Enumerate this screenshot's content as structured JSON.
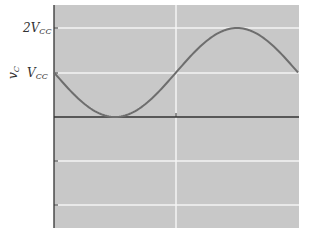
{
  "chart_data": {
    "type": "line",
    "title": "",
    "xlabel": "",
    "ylabel": "v_C",
    "ylabel_display": "vC",
    "y_ticks": [
      {
        "label": "2V_CC",
        "value": 2
      },
      {
        "label": "V_CC",
        "value": 1
      }
    ],
    "ylim": [
      -2.5,
      2.5
    ],
    "xlim": [
      0,
      6.2832
    ],
    "grid": true,
    "series": [
      {
        "name": "v_C",
        "function": "V_CC - V_CC*sin(theta)",
        "x": [
          0,
          0.785,
          1.571,
          2.356,
          3.142,
          3.927,
          4.712,
          5.498,
          6.283
        ],
        "values": [
          1,
          0.29,
          0,
          0.29,
          1,
          1.71,
          2,
          1.71,
          1
        ]
      }
    ],
    "colors": {
      "plot_bg": "#c8c8c8",
      "grid": "#f4f4f4",
      "curve": "#6e6e6e",
      "axis": "#333333"
    }
  },
  "labels": {
    "y_axis": "v",
    "y_axis_sub": "C",
    "tick_2vcc_main": "2V",
    "tick_2vcc_sub": "CC",
    "tick_vcc_main": "V",
    "tick_vcc_sub": "CC"
  }
}
